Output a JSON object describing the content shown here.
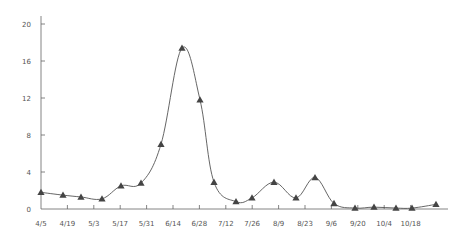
{
  "chart_data": {
    "type": "line",
    "title": "",
    "xlabel": "",
    "ylabel": "",
    "ylim": [
      0,
      20
    ],
    "yticks": [
      0,
      4,
      8,
      12,
      16,
      20
    ],
    "xtick_labels": [
      "4/5",
      "4/19",
      "5/3",
      "5/17",
      "5/31",
      "6/14",
      "6/28",
      "7/12",
      "7/26",
      "8/9",
      "8/23",
      "9/6",
      "9/20",
      "10/4",
      "10/18"
    ],
    "grid": false,
    "legend": null,
    "marker": "triangle",
    "smooth": true,
    "line_color": "#555555",
    "marker_color": "#444444",
    "series": [
      {
        "name": "series-1",
        "points": [
          {
            "x": 41,
            "y": 1.8
          },
          {
            "x": 63,
            "y": 1.5
          },
          {
            "x": 81,
            "y": 1.3
          },
          {
            "x": 102,
            "y": 1.1
          },
          {
            "x": 121,
            "y": 2.5
          },
          {
            "x": 141,
            "y": 2.8
          },
          {
            "x": 161,
            "y": 7.0
          },
          {
            "x": 182,
            "y": 17.4
          },
          {
            "x": 200,
            "y": 11.8
          },
          {
            "x": 214,
            "y": 2.9
          },
          {
            "x": 236,
            "y": 0.8
          },
          {
            "x": 252,
            "y": 1.2
          },
          {
            "x": 274,
            "y": 2.9
          },
          {
            "x": 296,
            "y": 1.2
          },
          {
            "x": 315,
            "y": 3.4
          },
          {
            "x": 334,
            "y": 0.6
          },
          {
            "x": 355,
            "y": 0.1
          },
          {
            "x": 374,
            "y": 0.2
          },
          {
            "x": 396,
            "y": 0.1
          },
          {
            "x": 412,
            "y": 0.1
          },
          {
            "x": 436,
            "y": 0.5
          }
        ]
      }
    ]
  }
}
